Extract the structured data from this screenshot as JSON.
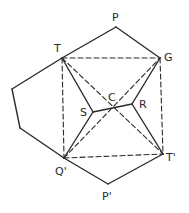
{
  "diagram": {
    "type": "geometric-construction",
    "stroke_color": "#2a2a2a",
    "background": "#ffffff",
    "points": {
      "P": {
        "label": "P",
        "x": 116,
        "y": 27,
        "lx": 112,
        "ly": 21
      },
      "T": {
        "label": "T",
        "x": 62,
        "y": 58,
        "lx": 54,
        "ly": 52
      },
      "G": {
        "label": "G",
        "x": 160,
        "y": 58,
        "lx": 164,
        "ly": 61
      },
      "L1": {
        "label": "",
        "x": 12,
        "y": 89
      },
      "L2": {
        "label": "",
        "x": 20,
        "y": 128
      },
      "S": {
        "label": "S",
        "x": 93,
        "y": 112,
        "lx": 80,
        "ly": 116
      },
      "C": {
        "label": "C",
        "x": 112,
        "y": 107,
        "lx": 108,
        "ly": 101
      },
      "R": {
        "label": "R",
        "x": 132,
        "y": 104,
        "lx": 139,
        "ly": 108
      },
      "Q": {
        "label": "Q'",
        "x": 64,
        "y": 158,
        "lx": 55,
        "ly": 175
      },
      "Tp": {
        "label": "T'",
        "x": 163,
        "y": 154,
        "lx": 166,
        "ly": 161
      },
      "Pp": {
        "label": "P'",
        "x": 108,
        "y": 184,
        "lx": 102,
        "ly": 200
      }
    },
    "solid_edges": [
      [
        "P",
        "T"
      ],
      [
        "P",
        "G"
      ],
      [
        "T",
        "L1"
      ],
      [
        "L1",
        "L2"
      ],
      [
        "L2",
        "Q"
      ],
      [
        "Q",
        "Pp"
      ],
      [
        "Pp",
        "Tp"
      ],
      [
        "T",
        "S"
      ],
      [
        "S",
        "Q"
      ],
      [
        "S",
        "R"
      ],
      [
        "R",
        "G"
      ],
      [
        "R",
        "Tp"
      ]
    ],
    "dashed_edges": [
      [
        "T",
        "G"
      ],
      [
        "T",
        "Q"
      ],
      [
        "G",
        "Tp"
      ],
      [
        "Q",
        "Tp"
      ],
      [
        "T",
        "Tp"
      ],
      [
        "Q",
        "G"
      ]
    ]
  }
}
